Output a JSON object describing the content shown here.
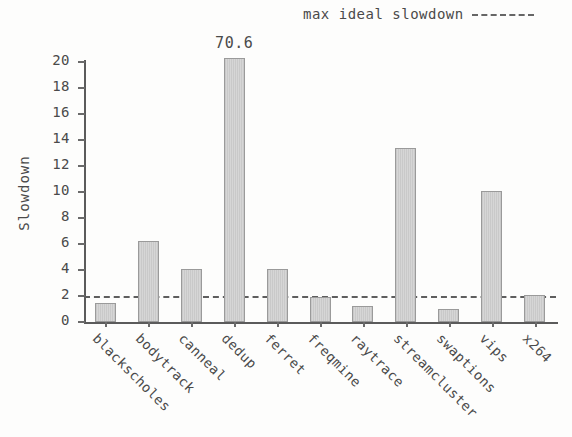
{
  "chart_data": {
    "type": "bar",
    "title": "",
    "xlabel": "",
    "ylabel": "Slowdown",
    "ylim": [
      0,
      20
    ],
    "ytick_labels": [
      "0",
      "2",
      "4",
      "6",
      "8",
      "10",
      "12",
      "14",
      "16",
      "18",
      "20"
    ],
    "ytick_values": [
      0,
      2,
      4,
      6,
      8,
      10,
      12,
      14,
      16,
      18,
      20
    ],
    "grid": false,
    "legend": [
      {
        "label": "max ideal slowdown",
        "style": "dashed-line",
        "color": "#5e5e5e"
      }
    ],
    "legend_position": "top-right",
    "annotations": [
      {
        "series": "Slowdown",
        "category": "dedup",
        "text": "70.6",
        "note": "bar clipped by axis limit"
      }
    ],
    "categories": [
      "blackscholes",
      "bodytrack",
      "canneal",
      "dedup",
      "ferret",
      "freqmine",
      "raytrace",
      "streamcluster",
      "swaptions",
      "vips",
      "x264"
    ],
    "values": [
      1.45,
      6.2,
      4.1,
      70.6,
      4.05,
      1.9,
      1.25,
      13.35,
      1.0,
      10.05,
      2.05
    ],
    "bar_color": "#cfcfcf",
    "bar_edge_color": "#9a9a9a",
    "threshold_line": {
      "value": 2,
      "label": "max ideal slowdown",
      "style": "dashed"
    }
  },
  "legend": {
    "label": "max ideal slowdown"
  }
}
